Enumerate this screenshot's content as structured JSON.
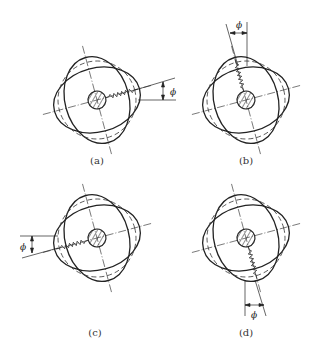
{
  "figure": {
    "panels": [
      {
        "id": "a",
        "label": "(a)",
        "cx": 97,
        "cy": 100,
        "angle": -15,
        "spring_dir": "right",
        "dim_symbol": "ϕ"
      },
      {
        "id": "b",
        "label": "(b)",
        "cx": 246,
        "cy": 100,
        "angle": -15,
        "spring_dir": "up",
        "dim_symbol": "ϕ"
      },
      {
        "id": "c",
        "label": "(c)",
        "cx": 97,
        "cy": 238,
        "angle": -15,
        "spring_dir": "left",
        "dim_symbol": "ϕ"
      },
      {
        "id": "d",
        "label": "(d)",
        "cx": 246,
        "cy": 238,
        "angle": -15,
        "spring_dir": "down",
        "dim_symbol": "ϕ"
      }
    ],
    "line_color": "#222222"
  }
}
